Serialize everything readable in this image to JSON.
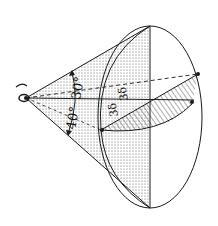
{
  "diagram": {
    "colors": {
      "line": "#1a1a1a",
      "background": "#ffffff",
      "dots": "#555555",
      "hatch": "#333333"
    },
    "labels": {
      "angle_inner": "30°",
      "angle_outer": "40°",
      "upper_value": "3δ",
      "lower_value": "3δ"
    },
    "icons": {
      "eye": "eye-icon"
    }
  }
}
